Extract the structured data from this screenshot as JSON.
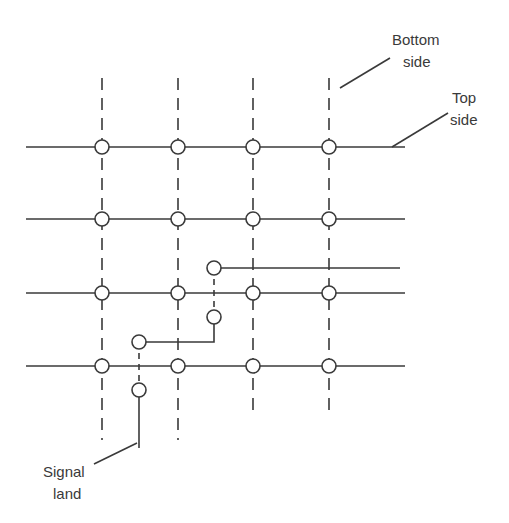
{
  "diagram": {
    "type": "pcb-grid-routing",
    "labels": {
      "bottom_side": [
        "Bottom",
        "side"
      ],
      "top_side": [
        "Top",
        "side"
      ],
      "signal_land": [
        "Signal",
        "land"
      ]
    },
    "grid": {
      "columns_x": [
        102,
        178,
        253,
        329
      ],
      "rows_y": [
        147,
        219,
        293,
        366
      ],
      "column_style": "dashed (bottom side)",
      "row_style": "solid (top side)",
      "pad_radius": 7
    },
    "signal_route": {
      "pads": [
        {
          "x": 214,
          "y": 268
        },
        {
          "x": 214,
          "y": 317
        },
        {
          "x": 139,
          "y": 342
        },
        {
          "x": 139,
          "y": 390
        }
      ]
    },
    "colors": {
      "line": "#3a3a3a",
      "background": "#ffffff"
    }
  }
}
